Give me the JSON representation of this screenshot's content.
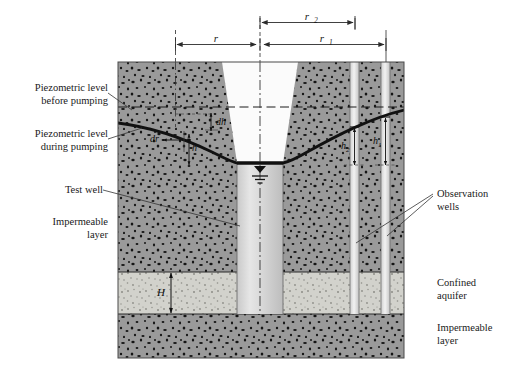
{
  "figure": {
    "type": "well-pumping-cross-section"
  },
  "dimensions": {
    "r": {
      "label": "r",
      "sub": ""
    },
    "r1": {
      "label": "r",
      "sub": "1"
    },
    "r2": {
      "label": "r",
      "sub": "2"
    }
  },
  "inline_labels": {
    "dr": "dr",
    "dh": "dh",
    "h": "h",
    "h1": {
      "base": "h",
      "sub": "1"
    },
    "h2": {
      "base": "h",
      "sub": "2"
    },
    "H": "H"
  },
  "left_labels": [
    {
      "name": "piezometric-before",
      "line1": "Piezometric level",
      "line2": "before pumping"
    },
    {
      "name": "piezometric-during",
      "line1": "Piezometric level",
      "line2": "during pumping"
    },
    {
      "name": "test-well",
      "line1": "Test well",
      "line2": ""
    },
    {
      "name": "impermeable-upper",
      "line1": "Impermeable",
      "line2": "layer"
    }
  ],
  "right_labels": [
    {
      "name": "observation-wells",
      "line1": "Observation",
      "line2": "wells"
    },
    {
      "name": "confined-aquifer",
      "line1": "Confined",
      "line2": "aquifer"
    },
    {
      "name": "impermeable-lower",
      "line1": "Impermeable",
      "line2": "layer"
    }
  ],
  "colors": {
    "soil_dark": "#9a9a9a",
    "aquifer_light": "#d2d2cc",
    "well_water": "#d9d9d9",
    "well_empty": "#fbfbfb",
    "line": "#151515",
    "dim_line": "#2b2b2b",
    "background": "#ffffff"
  },
  "geometry": {
    "diagram_left": 118,
    "diagram_right": 404,
    "diagram_top": 62,
    "diagram_bottom": 358,
    "piezometric_before_y": 107,
    "aquifer_top_y": 272,
    "aquifer_bottom_y": 314,
    "test_well_x": [
      237,
      283
    ],
    "obs_well_1_x": [
      381,
      390
    ],
    "obs_well_2_x": [
      350,
      359
    ]
  }
}
